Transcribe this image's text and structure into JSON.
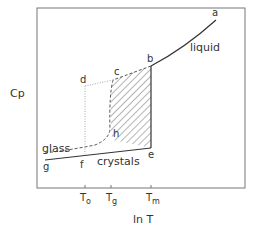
{
  "diagram": {
    "y_axis_label": "Cp",
    "x_axis_label": "ln T",
    "ticks": [
      {
        "main": "T",
        "sub": "o"
      },
      {
        "main": "T",
        "sub": "g"
      },
      {
        "main": "T",
        "sub": "m"
      }
    ],
    "curve_labels": {
      "liquid": "liquid",
      "glass": "glass",
      "crystals": "crystals"
    },
    "points": {
      "a": "a",
      "b": "b",
      "c": "c",
      "d": "d",
      "e": "e",
      "f": "f",
      "g": "g",
      "h": "h"
    },
    "colors": {
      "frame": "#777777",
      "curve": "#333333",
      "dashed": "#555555",
      "dotted": "#aaaaaa",
      "hatch": "#444444"
    }
  }
}
